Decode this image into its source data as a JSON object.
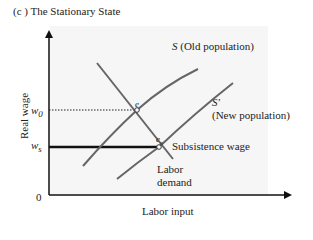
{
  "title": "(c ) The Stationary State",
  "axes": {
    "y_label": "Real wage",
    "x_label": "Labor input",
    "origin_label": "0"
  },
  "y_ticks": {
    "w0": {
      "base": "w",
      "sub": "0"
    },
    "ws": {
      "base": "w",
      "sub": "s"
    }
  },
  "curves": {
    "supply_old": {
      "symbol": "S",
      "label": "(Old population)"
    },
    "supply_new": {
      "symbol": "S'",
      "label": "(New population)"
    },
    "demand": {
      "label_line1": "Labor",
      "label_line2": "demand"
    },
    "subsistence": {
      "label": "Subsistence wage"
    }
  },
  "points": {
    "e": {
      "base": "e",
      "sub": ""
    },
    "es": {
      "base": "e",
      "sub": "s"
    }
  },
  "colors": {
    "axis": "#111111",
    "curve": "#666666",
    "subsistence_line": "#111111",
    "background": "#f6f6f6"
  }
}
